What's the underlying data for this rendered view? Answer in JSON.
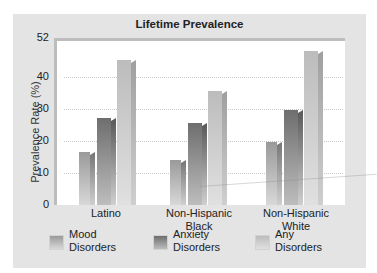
{
  "chart_data": {
    "type": "bar",
    "title": "Lifetime Prevalence",
    "xlabel": "",
    "ylabel": "Prevalence Rate (%)",
    "ylim": [
      0,
      52
    ],
    "yticks": [
      0,
      10,
      20,
      30,
      40,
      52
    ],
    "grid": true,
    "legend_position": "bottom",
    "categories": [
      "Latino",
      "Non-Hispanic Black",
      "Non-Hispanic White"
    ],
    "series": [
      {
        "name": "Mood Disorders",
        "values": [
          16.5,
          14,
          19.5
        ],
        "color": "#8a8a8a"
      },
      {
        "name": "Anxiety Disorders",
        "values": [
          27,
          25.5,
          29.5
        ],
        "color": "#707070"
      },
      {
        "name": "Any Disorders",
        "values": [
          45,
          35.5,
          48
        ],
        "color": "#b4b4b4"
      }
    ]
  },
  "labels": {
    "title": "Lifetime Prevalence",
    "ylabel": "Prevalence Rate (%)",
    "yticks": [
      "0",
      "10",
      "20",
      "30",
      "40",
      "52"
    ],
    "categories": [
      {
        "line1": "Latino",
        "line2": ""
      },
      {
        "line1": "Non-Hispanic",
        "line2": "Black"
      },
      {
        "line1": "Non-Hispanic",
        "line2": "White"
      }
    ],
    "legend": [
      {
        "line1": "Mood",
        "line2": "Disorders"
      },
      {
        "line1": "Anxiety",
        "line2": "Disorders"
      },
      {
        "line1": "Any",
        "line2": "Disorders"
      }
    ]
  }
}
